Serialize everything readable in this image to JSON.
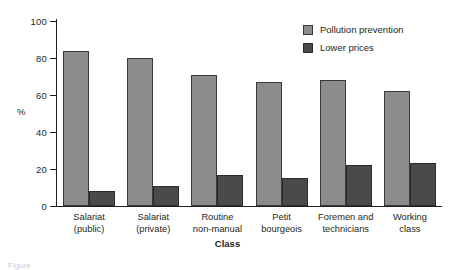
{
  "chart_data": {
    "type": "bar",
    "title": "",
    "xlabel": "Class",
    "ylabel": "%",
    "ylim": [
      0,
      100
    ],
    "yticks": [
      0,
      20,
      40,
      60,
      80,
      100
    ],
    "ytick_labels": [
      "0",
      "20",
      "40",
      "60",
      "80",
      "100"
    ],
    "grid": false,
    "legend_position": "top-right",
    "categories": [
      "Salariat\n(public)",
      "Salariat\n(private)",
      "Routine\nnon-manual",
      "Petit\nbourgeois",
      "Foremen and\ntechnicians",
      "Working\nclass"
    ],
    "series": [
      {
        "name": "Pollution prevention",
        "color": "#8c8c8c",
        "values": [
          84,
          80,
          71,
          67,
          68,
          62
        ]
      },
      {
        "name": "Lower prices",
        "color": "#4a4a4a",
        "values": [
          8,
          11,
          17,
          15,
          22,
          23
        ]
      }
    ]
  },
  "legend": {
    "items": [
      {
        "label": "Pollution prevention",
        "swatch": "prevention"
      },
      {
        "label": "Lower prices",
        "swatch": "prices"
      }
    ]
  },
  "caption": {
    "text": "Figure"
  }
}
